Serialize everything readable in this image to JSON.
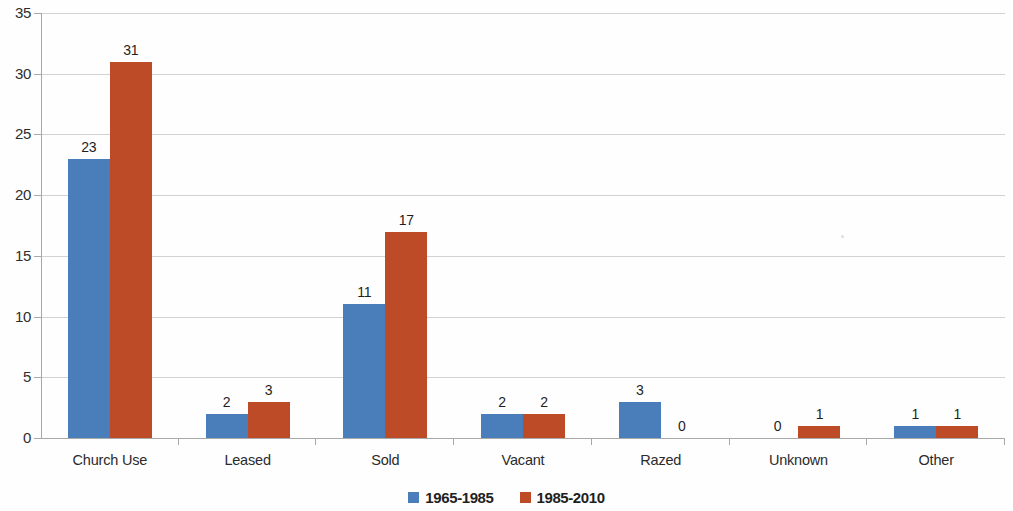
{
  "chart_data": {
    "type": "bar",
    "title": "",
    "subtitle": "",
    "xlabel": "",
    "ylabel": "",
    "categories": [
      "Church Use",
      "Leased",
      "Sold",
      "Vacant",
      "Razed",
      "Unknown",
      "Other"
    ],
    "series": [
      {
        "name": "1965-1985",
        "color": "#4a7ebb",
        "values": [
          23,
          2,
          11,
          2,
          3,
          0,
          1
        ]
      },
      {
        "name": "1985-2010",
        "color": "#be4b28",
        "values": [
          31,
          3,
          17,
          2,
          0,
          1,
          1
        ]
      }
    ],
    "ylim": [
      0,
      35
    ],
    "ytick_values": [
      0,
      5,
      10,
      15,
      20,
      25,
      30,
      35
    ],
    "ytick_labels": [
      "0",
      "5",
      "10",
      "15",
      "20",
      "25",
      "30",
      "35"
    ],
    "data_labels": {
      "1965-1985": [
        "23",
        "2",
        "11",
        "2",
        "3",
        "0",
        "1"
      ],
      "1985-2010": [
        "31",
        "3",
        "17",
        "2",
        "0",
        "1",
        "1"
      ]
    },
    "grid": true,
    "grid_axis": "y",
    "legend": true,
    "legend_position": "bottom",
    "bar_gap_within_group": 0,
    "background_color": "#fefefe",
    "gridline_color": "#d2d2d2",
    "axis_color": "#a8a8a8",
    "text_color": "#2e2e2e"
  }
}
